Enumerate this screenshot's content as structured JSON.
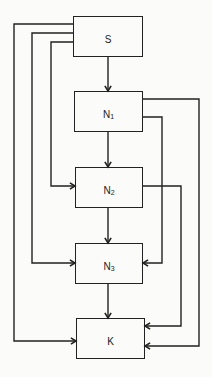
{
  "diagram": {
    "colors": {
      "line": "#222222",
      "background": "#fbfbf9"
    },
    "nodes": [
      {
        "id": "S",
        "label": "S",
        "sub": "",
        "x": 73,
        "y": 16,
        "w": 70,
        "h": 41
      },
      {
        "id": "N1",
        "label": "N",
        "sub": "1",
        "x": 74,
        "y": 91,
        "w": 69,
        "h": 41
      },
      {
        "id": "N2",
        "label": "N",
        "sub": "2",
        "x": 75,
        "y": 167,
        "w": 68,
        "h": 41
      },
      {
        "id": "N3",
        "label": "N",
        "sub": "3",
        "x": 75,
        "y": 243,
        "w": 68,
        "h": 41
      },
      {
        "id": "K",
        "label": "K",
        "sub": "",
        "x": 76,
        "y": 318,
        "w": 69,
        "h": 41
      }
    ],
    "edges": [
      {
        "from": "S",
        "to": "N1",
        "points": [
          [
            108,
            57
          ],
          [
            108,
            91
          ]
        ]
      },
      {
        "from": "N1",
        "to": "N2",
        "points": [
          [
            108,
            132
          ],
          [
            108,
            167
          ]
        ]
      },
      {
        "from": "N2",
        "to": "N3",
        "points": [
          [
            108,
            208
          ],
          [
            108,
            243
          ]
        ]
      },
      {
        "from": "N3",
        "to": "K",
        "points": [
          [
            108,
            284
          ],
          [
            108,
            318
          ]
        ]
      },
      {
        "from": "S",
        "to": "K",
        "points": [
          [
            73,
            24
          ],
          [
            14,
            24
          ],
          [
            14,
            341
          ],
          [
            76,
            341
          ]
        ]
      },
      {
        "from": "S",
        "to": "N3",
        "points": [
          [
            73,
            33
          ],
          [
            32,
            33
          ],
          [
            32,
            263
          ],
          [
            75,
            263
          ]
        ]
      },
      {
        "from": "S",
        "to": "N2",
        "points": [
          [
            73,
            42
          ],
          [
            51,
            42
          ],
          [
            51,
            186
          ],
          [
            75,
            186
          ]
        ]
      },
      {
        "from": "N1",
        "to": "K",
        "points": [
          [
            143,
            99
          ],
          [
            199,
            99
          ],
          [
            199,
            346
          ],
          [
            145,
            346
          ]
        ]
      },
      {
        "from": "N1",
        "to": "N3",
        "points": [
          [
            143,
            117
          ],
          [
            162,
            117
          ],
          [
            162,
            263
          ],
          [
            143,
            263
          ]
        ]
      },
      {
        "from": "N2",
        "to": "K",
        "points": [
          [
            143,
            186
          ],
          [
            181,
            186
          ],
          [
            181,
            326
          ],
          [
            145,
            326
          ]
        ]
      }
    ]
  }
}
